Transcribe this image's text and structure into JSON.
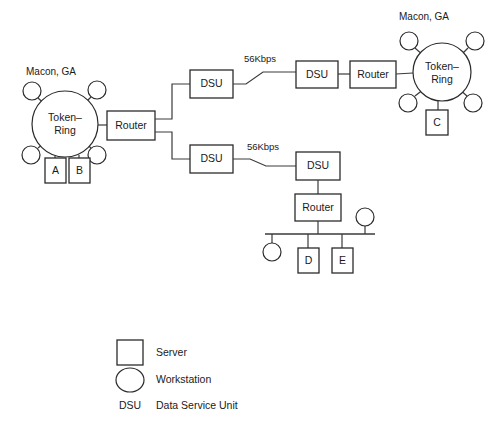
{
  "diagram": {
    "colors": {
      "background": "#ffffff",
      "stroke": "#2b2b2b",
      "link": "#3a3a3a",
      "text": "#1a1a1a",
      "shape_fill": "#ffffff"
    },
    "site_labels": [
      {
        "id": "site-left",
        "text": "Macon, GA",
        "x": 26,
        "y": 75
      },
      {
        "id": "site-right",
        "text": "Macon, GA",
        "x": 399,
        "y": 20
      }
    ],
    "rings": [
      {
        "id": "ring-left",
        "label_line1": "Token–",
        "label_line2": "Ring",
        "cx": 65,
        "cy": 124,
        "r": 33
      },
      {
        "id": "ring-right",
        "label_line1": "Token–",
        "label_line2": "Ring",
        "cx": 442,
        "cy": 72,
        "r": 29
      }
    ],
    "boxes": [
      {
        "id": "router-left",
        "label": "Router",
        "x": 107,
        "y": 111,
        "w": 48,
        "h": 29
      },
      {
        "id": "dsu-top-left",
        "label": "DSU",
        "x": 190,
        "y": 70,
        "w": 43,
        "h": 28
      },
      {
        "id": "dsu-top-right",
        "label": "DSU",
        "x": 296,
        "y": 61,
        "w": 42,
        "h": 27
      },
      {
        "id": "router-top-right",
        "label": "Router",
        "x": 350,
        "y": 61,
        "w": 46,
        "h": 27
      },
      {
        "id": "dsu-bot-left",
        "label": "DSU",
        "x": 190,
        "y": 145,
        "w": 43,
        "h": 28
      },
      {
        "id": "dsu-bot-right",
        "label": "DSU",
        "x": 296,
        "y": 152,
        "w": 44,
        "h": 28
      },
      {
        "id": "router-bottom",
        "label": "Router",
        "x": 295,
        "y": 194,
        "w": 46,
        "h": 27
      },
      {
        "id": "server-a",
        "label": "A",
        "x": 45,
        "y": 158,
        "w": 21,
        "h": 25
      },
      {
        "id": "server-b",
        "label": "B",
        "x": 69,
        "y": 158,
        "w": 21,
        "h": 25
      },
      {
        "id": "server-c",
        "label": "C",
        "x": 426,
        "y": 110,
        "w": 22,
        "h": 25
      },
      {
        "id": "server-d",
        "label": "D",
        "x": 298,
        "y": 248,
        "w": 21,
        "h": 25
      },
      {
        "id": "server-e",
        "label": "E",
        "x": 332,
        "y": 248,
        "w": 21,
        "h": 25
      }
    ],
    "workstations": [
      {
        "id": "ws-left-tl",
        "cx": 32,
        "cy": 91,
        "r": 9
      },
      {
        "id": "ws-left-tr",
        "cx": 97,
        "cy": 90,
        "r": 9
      },
      {
        "id": "ws-left-bl",
        "cx": 31,
        "cy": 155,
        "r": 9
      },
      {
        "id": "ws-left-br",
        "cx": 97,
        "cy": 155,
        "r": 9
      },
      {
        "id": "ws-right-tl",
        "cx": 409,
        "cy": 41,
        "r": 9
      },
      {
        "id": "ws-right-tr",
        "cx": 475,
        "cy": 41,
        "r": 9
      },
      {
        "id": "ws-right-bl",
        "cx": 408,
        "cy": 103,
        "r": 9
      },
      {
        "id": "ws-right-br",
        "cx": 473,
        "cy": 103,
        "r": 9
      },
      {
        "id": "ws-bus-left",
        "cx": 272,
        "cy": 252,
        "r": 9
      },
      {
        "id": "ws-bus-right",
        "cx": 365,
        "cy": 217,
        "r": 9
      }
    ],
    "speed_labels": [
      {
        "id": "speed-top",
        "text": "56Kbps",
        "x": 260,
        "y": 62
      },
      {
        "id": "speed-bottom",
        "text": "56Kbps",
        "x": 263,
        "y": 150
      }
    ],
    "legend": {
      "items": [
        {
          "id": "legend-server",
          "symbol": "square",
          "label": "Server"
        },
        {
          "id": "legend-workstation",
          "symbol": "circle",
          "label": "Workstation"
        },
        {
          "id": "legend-dsu",
          "symbol": "text",
          "abbr": "DSU",
          "label": "Data Service Unit"
        }
      ]
    }
  }
}
